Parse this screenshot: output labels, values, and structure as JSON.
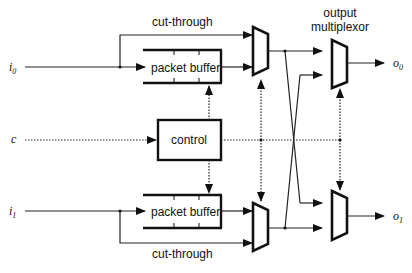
{
  "diagram": {
    "inputs": [
      {
        "name": "i",
        "sub": "0"
      },
      {
        "name": "i",
        "sub": "1"
      }
    ],
    "control_input": {
      "name": "c"
    },
    "outputs": [
      {
        "name": "o",
        "sub": "0"
      },
      {
        "name": "o",
        "sub": "1"
      }
    ],
    "labels": {
      "cut_through_top": "cut-through",
      "cut_through_bottom": "cut-through",
      "packet_buffer_top": "packet buffer",
      "packet_buffer_bottom": "packet buffer",
      "control": "control",
      "output_mux_line1": "output",
      "output_mux_line2": "multiplexor"
    }
  }
}
